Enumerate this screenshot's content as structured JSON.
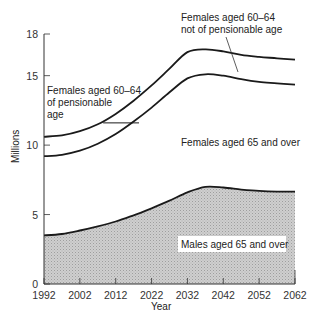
{
  "chart_data": {
    "type": "area",
    "title": "",
    "xlabel": "Year",
    "ylabel": "Millions",
    "xlim": [
      1992,
      2062
    ],
    "ylim": [
      0,
      18
    ],
    "x_ticks": [
      1992,
      2002,
      2012,
      2022,
      2032,
      2042,
      2052,
      2062
    ],
    "y_ticks": [
      0,
      5,
      10,
      15,
      18
    ],
    "grid": false,
    "legend": "none (inline labels)",
    "x": [
      1992,
      1997,
      2002,
      2007,
      2012,
      2017,
      2022,
      2027,
      2032,
      2037,
      2042,
      2047,
      2052,
      2057,
      2062
    ],
    "series": [
      {
        "name": "Males aged 65 and over",
        "kind": "cumulative line (shaded area below)",
        "values": [
          3.5,
          3.6,
          3.85,
          4.15,
          4.5,
          4.95,
          5.45,
          6.0,
          6.6,
          7.0,
          6.95,
          6.8,
          6.7,
          6.65,
          6.65
        ]
      },
      {
        "name": "Females aged 65 and over (cumulative total)",
        "kind": "cumulative line",
        "values": [
          9.2,
          9.3,
          9.6,
          10.1,
          10.8,
          11.7,
          12.7,
          13.8,
          14.8,
          15.1,
          15.0,
          14.75,
          14.55,
          14.45,
          14.35
        ]
      },
      {
        "name": "Females aged 60-64 (cumulative total)",
        "kind": "cumulative line",
        "values": [
          10.6,
          10.7,
          11.0,
          11.5,
          12.25,
          13.2,
          14.3,
          15.5,
          16.7,
          16.9,
          16.75,
          16.5,
          16.35,
          16.25,
          16.15
        ]
      }
    ],
    "annotations": [
      {
        "text": "Females aged 60–64 of pensionable age",
        "region": "left band 1992–2012 between middle and top curves"
      },
      {
        "text": "Females aged 60–64 not of pensionable age",
        "region": "right band after ~2018, pointer line to band"
      },
      {
        "text": "Females aged 65 and over",
        "region": "band between lower and middle curves"
      },
      {
        "text": "Males aged 65 and over",
        "region": "shaded area below lower curve"
      },
      {
        "text": "",
        "region": "horizontal divider at ~11.6 million from ~2008 to ~2018 marking pensionable age change"
      }
    ],
    "divider": {
      "x_start": 2008.5,
      "x_end": 2018.5,
      "y": 11.6
    }
  },
  "labels": {
    "top_left_line1": "Females aged 60–64",
    "top_left_line2": "of pensionable",
    "top_left_line3": "age",
    "top_right_line1": "Females aged 60–64",
    "top_right_line2": "not of pensionable age",
    "mid": "Females aged 65 and over",
    "bottom": "Males aged 65 and over",
    "xlabel": "Year",
    "ylabel": "Millions"
  },
  "style": {
    "line_color": "#1a1a1a",
    "fill_color": "#c8c8c8",
    "axis_color": "#333333"
  }
}
